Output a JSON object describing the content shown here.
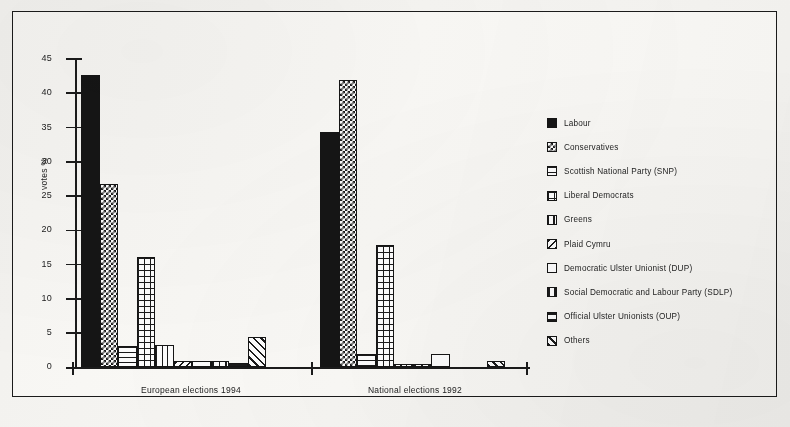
{
  "chart_data": {
    "type": "bar",
    "title": "",
    "xlabel": "",
    "ylabel": "votes %",
    "ylim": [
      0,
      45
    ],
    "yticks": [
      0,
      5,
      10,
      15,
      20,
      25,
      30,
      35,
      40,
      45
    ],
    "grid": false,
    "legend_position": "right",
    "categories": [
      "European elections 1994",
      "National elections 1992"
    ],
    "series": [
      {
        "name": "Labour",
        "pattern": "solid",
        "values": [
          42.7,
          34.4
        ]
      },
      {
        "name": "Conservatives",
        "pattern": "dots",
        "values": [
          26.8,
          41.9
        ]
      },
      {
        "name": "Scottish National Party (SNP)",
        "pattern": "hlines",
        "values": [
          3.1,
          1.9
        ]
      },
      {
        "name": "Liberal Democrats",
        "pattern": "grid",
        "values": [
          16.1,
          17.8
        ]
      },
      {
        "name": "Greens",
        "pattern": "vlines",
        "values": [
          3.2,
          0.5
        ]
      },
      {
        "name": "Plaid Cymru",
        "pattern": "diag",
        "values": [
          1.0,
          0.5
        ]
      },
      {
        "name": "Democratic Ulster Unionist (DUP)",
        "pattern": "empty",
        "values": [
          1.0,
          1.9
        ]
      },
      {
        "name": "Social Democratic and Labour Party (SDLP)",
        "pattern": "vlines-wide",
        "values": [
          1.0,
          0.0
        ]
      },
      {
        "name": "Official Ulster Unionists (OUP)",
        "pattern": "hlines-wide",
        "values": [
          0.7,
          0.0
        ]
      },
      {
        "name": "Others",
        "pattern": "diag2",
        "values": [
          4.4,
          1.0
        ]
      }
    ]
  },
  "axis": {
    "y_title": "votes %",
    "tick_labels": [
      "45",
      "40",
      "35",
      "30",
      "25",
      "20",
      "15",
      "10",
      "5",
      "0"
    ]
  },
  "legend": {
    "items": [
      {
        "label": "Labour",
        "pattern": "solid"
      },
      {
        "label": "Conservatives",
        "pattern": "dots"
      },
      {
        "label": "Scottish National Party (SNP)",
        "pattern": "hlines"
      },
      {
        "label": "Liberal Democrats",
        "pattern": "grid"
      },
      {
        "label": "Greens",
        "pattern": "vlines"
      },
      {
        "label": "Plaid Cymru",
        "pattern": "diag"
      },
      {
        "label": "Democratic Ulster Unionist (DUP)",
        "pattern": "empty"
      },
      {
        "label": "Social Democratic and Labour Party (SDLP)",
        "pattern": "vlines-wide"
      },
      {
        "label": "Official Ulster Unionists (OUP)",
        "pattern": "hlines-wide"
      },
      {
        "label": "Others",
        "pattern": "diag2"
      }
    ]
  },
  "colors": {
    "ink": "#1b1b1b",
    "paper": "#fbfaf7",
    "page": "#f7f6f3"
  }
}
